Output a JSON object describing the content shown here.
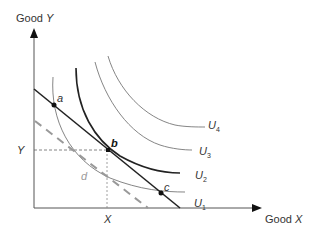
{
  "axes": {
    "y_label_prefix": "Good ",
    "y_label_var": "Y",
    "x_label_prefix": "Good ",
    "x_label_var": "X",
    "y_tick": "Y",
    "x_tick": "X"
  },
  "points": {
    "a": "a",
    "b": "b",
    "c": "c",
    "d": "d"
  },
  "curves": [
    {
      "label": "U",
      "sub": "1"
    },
    {
      "label": "U",
      "sub": "2"
    },
    {
      "label": "U",
      "sub": "3"
    },
    {
      "label": "U",
      "sub": "4"
    }
  ],
  "colors": {
    "axis": "#333333",
    "budget_line": "#222222",
    "dashed_budget": "#999999",
    "curve_thin": "#777777",
    "curve_bold": "#222222",
    "guide": "#666666"
  }
}
